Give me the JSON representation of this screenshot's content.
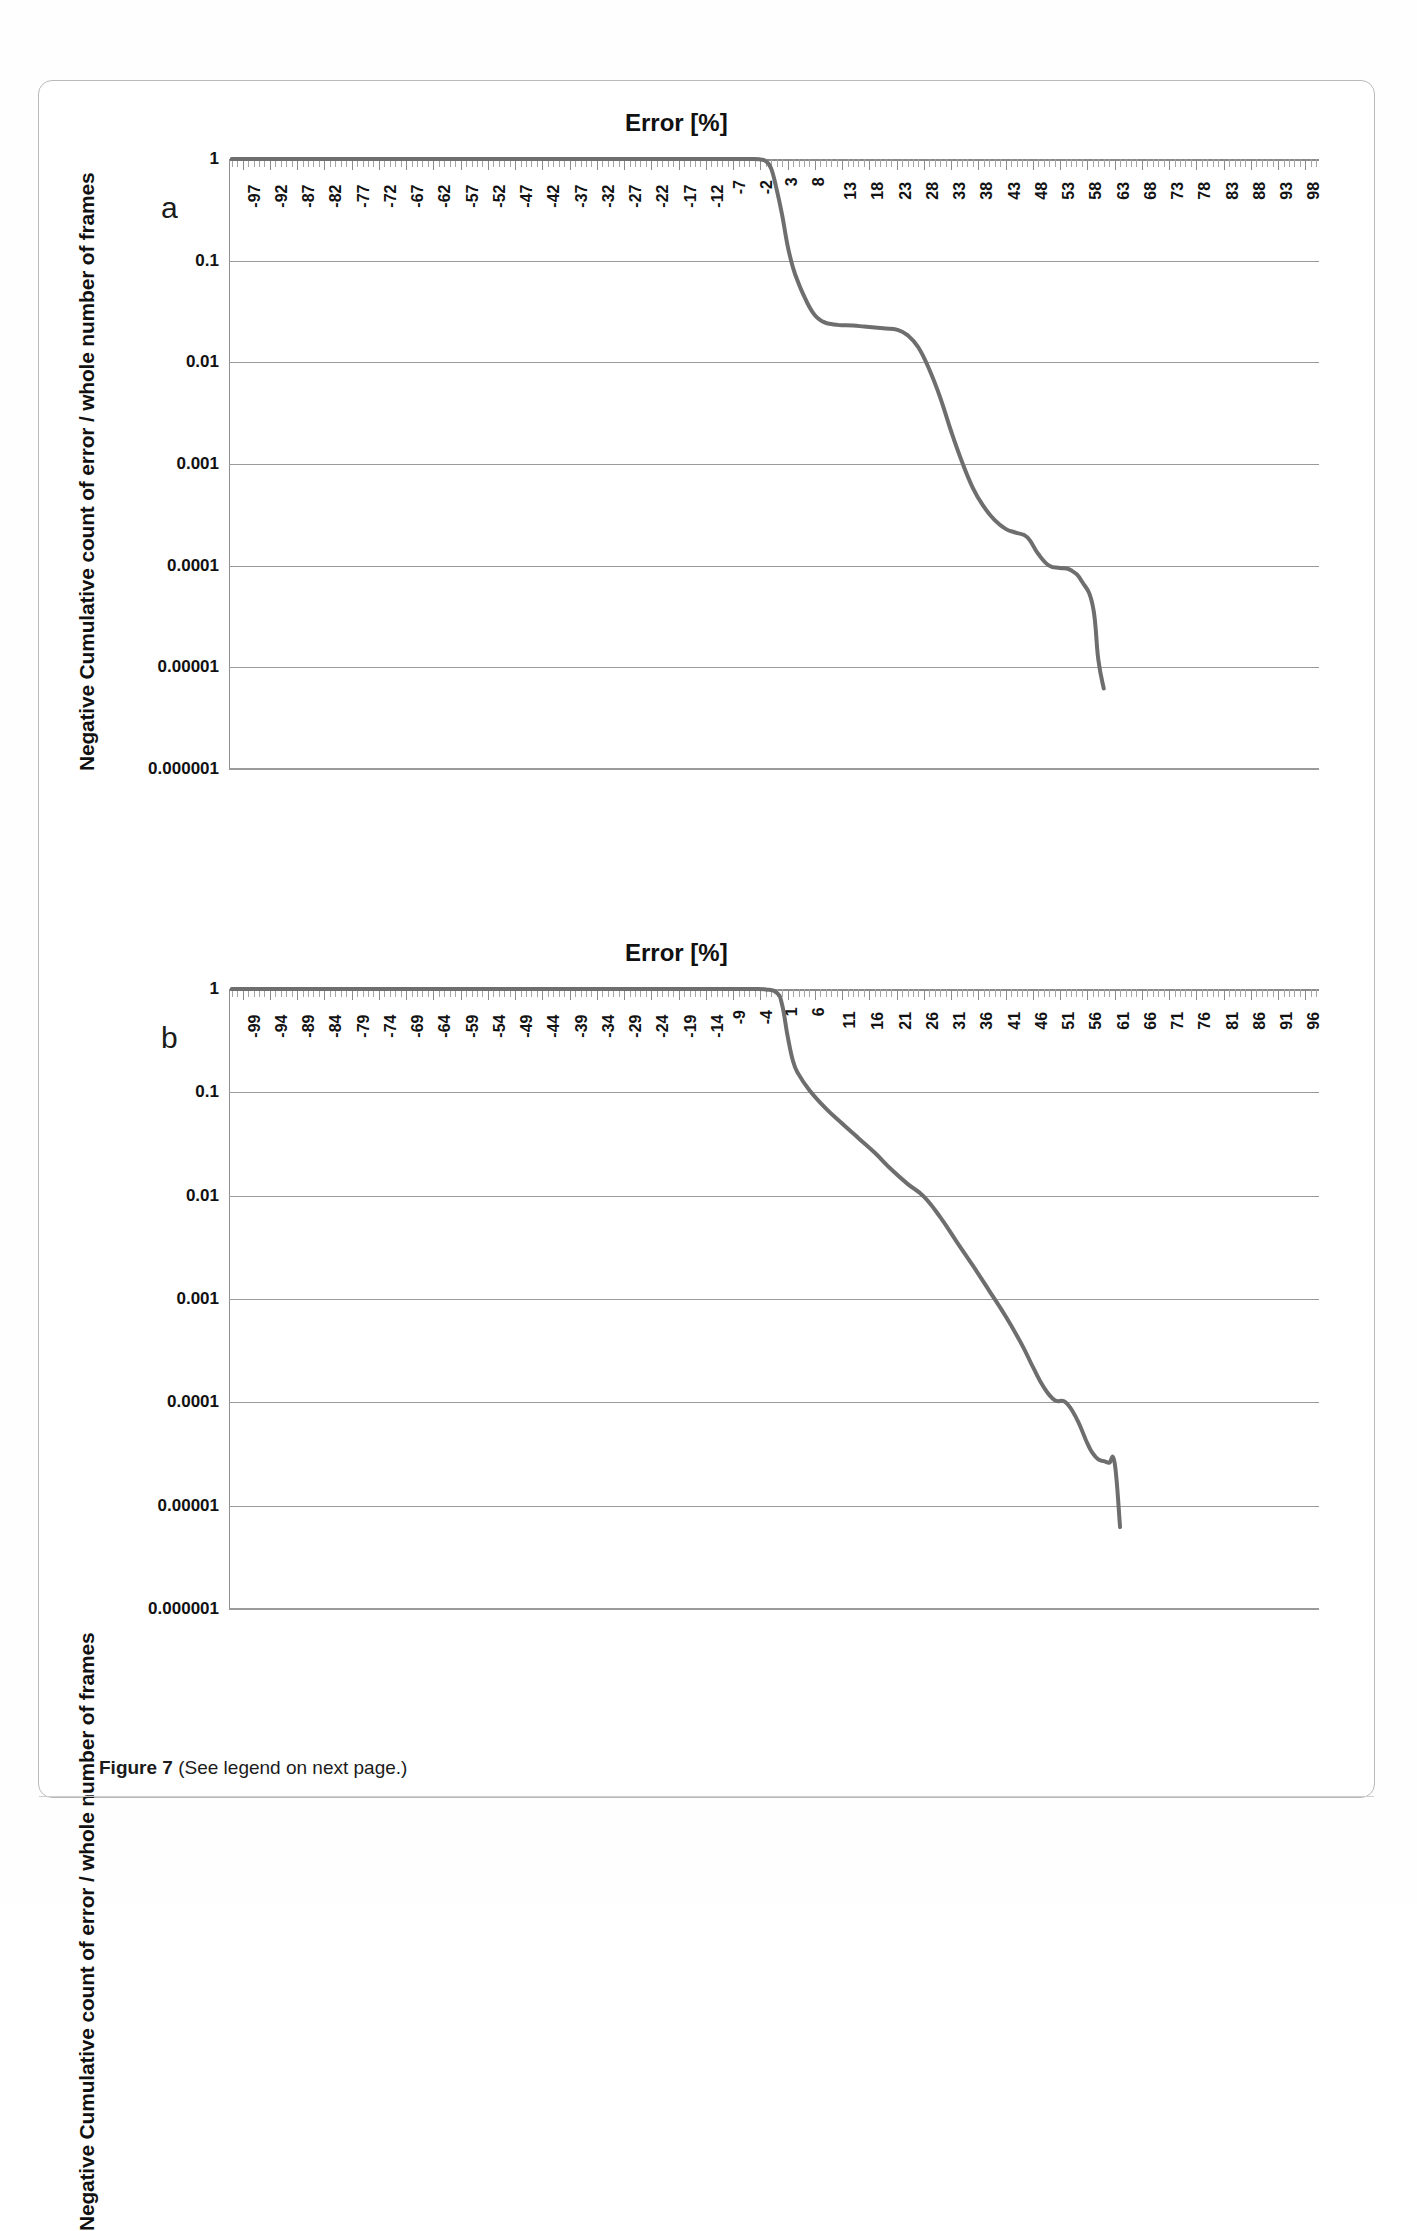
{
  "figure": {
    "caption_label": "Figure 7",
    "caption_text": " (See legend on next page.)"
  },
  "panels": [
    {
      "letter": "a",
      "title": "Error [%]",
      "ylabel": "Negative Cumulative count of error / whole number of frames"
    },
    {
      "letter": "b",
      "title": "Error [%]",
      "ylabel": "Negative Cumulative count of error / whole number of frames"
    }
  ],
  "chart_data": [
    {
      "type": "line",
      "title": "Error [%]",
      "panel": "a",
      "xlabel": "Error [%]",
      "ylabel": "Negative Cumulative count of error / whole number of frames",
      "yscale": "log",
      "ylim": [
        1e-06,
        1
      ],
      "ytick_labels": [
        "1",
        "0.1",
        "0.01",
        "0.001",
        "0.0001",
        "0.00001",
        "0.000001"
      ],
      "ytick_values": [
        1,
        0.1,
        0.01,
        0.001,
        0.0001,
        1e-05,
        1e-06
      ],
      "xlim": [
        -99.5,
        100.5
      ],
      "xtick_labels": [
        "-97",
        "-92",
        "-87",
        "-82",
        "-77",
        "-72",
        "-67",
        "-62",
        "-57",
        "-52",
        "-47",
        "-42",
        "-37",
        "-32",
        "-27",
        "-22",
        "-17",
        "-12",
        "-7",
        "-2",
        "3",
        "8",
        "13",
        "18",
        "23",
        "28",
        "33",
        "38",
        "43",
        "48",
        "53",
        "58",
        "63",
        "68",
        "73",
        "78",
        "83",
        "88",
        "93",
        "98"
      ],
      "xtick_values": [
        -97,
        -92,
        -87,
        -82,
        -77,
        -72,
        -67,
        -62,
        -57,
        -52,
        -47,
        -42,
        -37,
        -32,
        -27,
        -22,
        -17,
        -12,
        -7,
        -2,
        3,
        8,
        13,
        18,
        23,
        28,
        33,
        38,
        43,
        48,
        53,
        58,
        63,
        68,
        73,
        78,
        83,
        88,
        93,
        98
      ],
      "grid": "horizontal",
      "legend": "none",
      "line_color": "#6e6e6e",
      "series": [
        {
          "name": "Negative cumulative error distribution (a)",
          "x": [
            -99,
            -60,
            -30,
            -10,
            -4,
            -2,
            -1,
            0,
            1,
            2,
            3,
            4,
            5,
            6,
            7,
            8,
            9,
            10,
            11,
            12,
            13,
            15,
            17,
            19,
            21,
            23,
            25,
            27,
            29,
            31,
            33,
            35,
            37,
            39,
            41,
            43,
            45,
            47,
            49,
            51,
            53,
            55,
            57,
            59,
            60,
            61
          ],
          "y": [
            1,
            1,
            1,
            1,
            1,
            0.99,
            0.95,
            0.8,
            0.5,
            0.28,
            0.14,
            0.085,
            0.06,
            0.045,
            0.035,
            0.029,
            0.026,
            0.0245,
            0.0238,
            0.0234,
            0.0232,
            0.023,
            0.0225,
            0.022,
            0.0215,
            0.021,
            0.0185,
            0.014,
            0.0085,
            0.0045,
            0.0021,
            0.00105,
            0.00058,
            0.00038,
            0.00028,
            0.00023,
            0.00021,
            0.00019,
            0.00013,
            0.0001,
            9.5e-05,
            9e-05,
            7e-05,
            4e-05,
            1.2e-05,
            6.2e-06
          ]
        }
      ]
    },
    {
      "type": "line",
      "title": "Error [%]",
      "panel": "b",
      "xlabel": "Error [%]",
      "ylabel": "Negative Cumulative count of error / whole number of frames",
      "yscale": "log",
      "ylim": [
        1e-06,
        1
      ],
      "ytick_labels": [
        "1",
        "0.1",
        "0.01",
        "0.001",
        "0.0001",
        "0.00001",
        "0.000001"
      ],
      "ytick_values": [
        1,
        0.1,
        0.01,
        0.001,
        0.0001,
        1e-05,
        1e-06
      ],
      "xlim": [
        -101.5,
        98.5
      ],
      "xtick_labels": [
        "-99",
        "-94",
        "-89",
        "-84",
        "-79",
        "-74",
        "-69",
        "-64",
        "-59",
        "-54",
        "-49",
        "-44",
        "-39",
        "-34",
        "-29",
        "-24",
        "-19",
        "-14",
        "-9",
        "-4",
        "1",
        "6",
        "11",
        "16",
        "21",
        "26",
        "31",
        "36",
        "41",
        "46",
        "51",
        "56",
        "61",
        "66",
        "71",
        "76",
        "81",
        "86",
        "91",
        "96"
      ],
      "xtick_values": [
        -99,
        -94,
        -89,
        -84,
        -79,
        -74,
        -69,
        -64,
        -59,
        -54,
        -49,
        -44,
        -39,
        -34,
        -29,
        -24,
        -19,
        -14,
        -9,
        -4,
        1,
        6,
        11,
        16,
        21,
        26,
        31,
        36,
        41,
        46,
        51,
        56,
        61,
        66,
        71,
        76,
        81,
        86,
        91,
        96
      ],
      "grid": "horizontal",
      "legend": "none",
      "line_color": "#6e6e6e",
      "series": [
        {
          "name": "Negative cumulative error distribution (b)",
          "x": [
            -101,
            -60,
            -30,
            -12,
            -6,
            -3,
            -1,
            0,
            1,
            2,
            3,
            5,
            8,
            11,
            14,
            17,
            20,
            23,
            26,
            29,
            32,
            35,
            38,
            41,
            44,
            46,
            48,
            50,
            52,
            54,
            56,
            57,
            58,
            59,
            60,
            61,
            62
          ],
          "y": [
            1,
            1,
            1,
            1,
            1,
            0.99,
            0.92,
            0.7,
            0.35,
            0.2,
            0.15,
            0.105,
            0.07,
            0.05,
            0.036,
            0.026,
            0.018,
            0.013,
            0.0098,
            0.0062,
            0.0036,
            0.0021,
            0.0012,
            0.00068,
            0.00036,
            0.00022,
            0.00014,
            0.000105,
            0.0001,
            7e-05,
            4e-05,
            3.2e-05,
            2.8e-05,
            2.7e-05,
            2.6e-05,
            2.6e-05,
            6.2e-06
          ]
        }
      ]
    }
  ],
  "colors": {
    "curve": "#6e6e6e",
    "grid": "#9a9a9a",
    "axis": "#8c8c8c",
    "text": "#111111",
    "page_border": "#b9b9b9"
  }
}
